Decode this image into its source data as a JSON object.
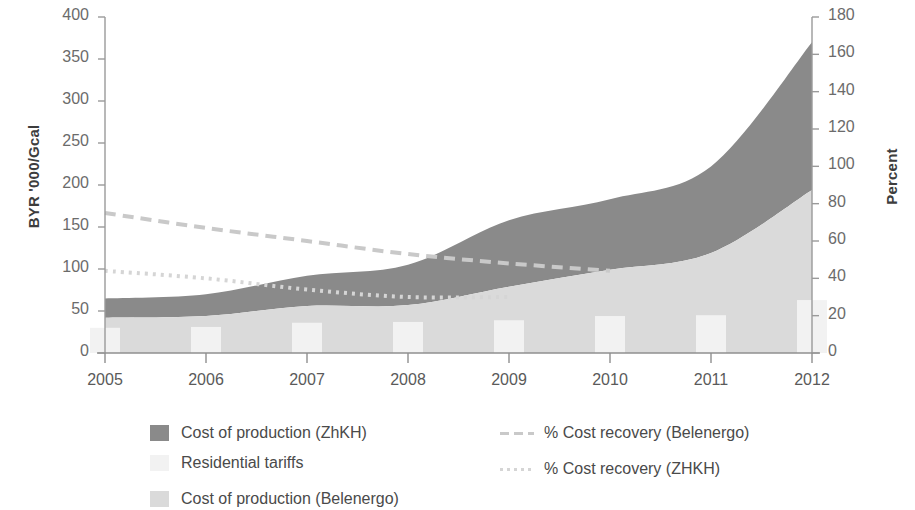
{
  "chart_data": {
    "type": "area",
    "title": "",
    "xlabel": "",
    "ylabel": "BYR '000/Gcal",
    "ylabel_right": "Percent",
    "categories": [
      "2005",
      "2006",
      "2007",
      "2008",
      "2009",
      "2010",
      "2011",
      "2012"
    ],
    "x": [
      2005,
      2006,
      2007,
      2008,
      2009,
      2010,
      2011,
      2012
    ],
    "ylim": [
      0,
      400
    ],
    "ylim_right": [
      0,
      180
    ],
    "yticks": [
      0,
      50,
      100,
      150,
      200,
      250,
      300,
      350,
      400
    ],
    "yticks_right": [
      0,
      20,
      40,
      60,
      80,
      100,
      120,
      140,
      160,
      180
    ],
    "grid": false,
    "legend_position": "bottom",
    "series": [
      {
        "name": "Cost of production (ZhKH)",
        "kind": "area",
        "axis": "left",
        "color": "#8a8a8a",
        "values": [
          65,
          70,
          92,
          105,
          158,
          183,
          222,
          370
        ]
      },
      {
        "name": "Cost of production (Belenergo)",
        "kind": "area",
        "axis": "left",
        "color": "#dadada",
        "values": [
          42,
          44,
          56,
          57,
          79,
          99,
          119,
          194
        ]
      },
      {
        "name": "Residential tariffs",
        "kind": "bar",
        "axis": "left",
        "color": "#f2f2f2",
        "values": [
          30,
          31,
          36,
          37,
          39,
          44,
          45,
          63
        ]
      },
      {
        "name": "% Cost recovery (Belenergo)",
        "kind": "line-dashed",
        "axis": "right",
        "color": "#c9c9c9",
        "values": [
          75,
          67,
          60,
          53,
          48,
          44,
          null,
          null
        ]
      },
      {
        "name": "% Cost recovery (ZHKH)",
        "kind": "line-dotted",
        "axis": "right",
        "color": "#d5d5d5",
        "values": [
          44,
          40,
          34,
          30,
          30,
          null,
          null,
          null
        ]
      }
    ]
  },
  "legend": {
    "left_column": [
      {
        "label": "Cost of production (ZhKH)",
        "marker": "swatch-dark"
      },
      {
        "label": "Residential tariffs",
        "marker": "swatch-pale"
      },
      {
        "label": "Cost of production (Belenergo)",
        "marker": "swatch-light"
      }
    ],
    "right_column": [
      {
        "label": "% Cost recovery (Belenergo)",
        "marker": "line-dashed"
      },
      {
        "label": "% Cost recovery (ZHKH)",
        "marker": "line-dotted"
      }
    ]
  },
  "axes": {
    "left_title": "BYR '000/Gcal",
    "right_title": "Percent",
    "left_ticks": [
      "400",
      "350",
      "300",
      "250",
      "200",
      "150",
      "100",
      "50",
      "0"
    ],
    "right_ticks": [
      "180",
      "160",
      "140",
      "120",
      "100",
      "80",
      "60",
      "40",
      "20",
      "0"
    ],
    "x_ticks": [
      "2005",
      "2006",
      "2007",
      "2008",
      "2009",
      "2010",
      "2011",
      "2012"
    ]
  }
}
